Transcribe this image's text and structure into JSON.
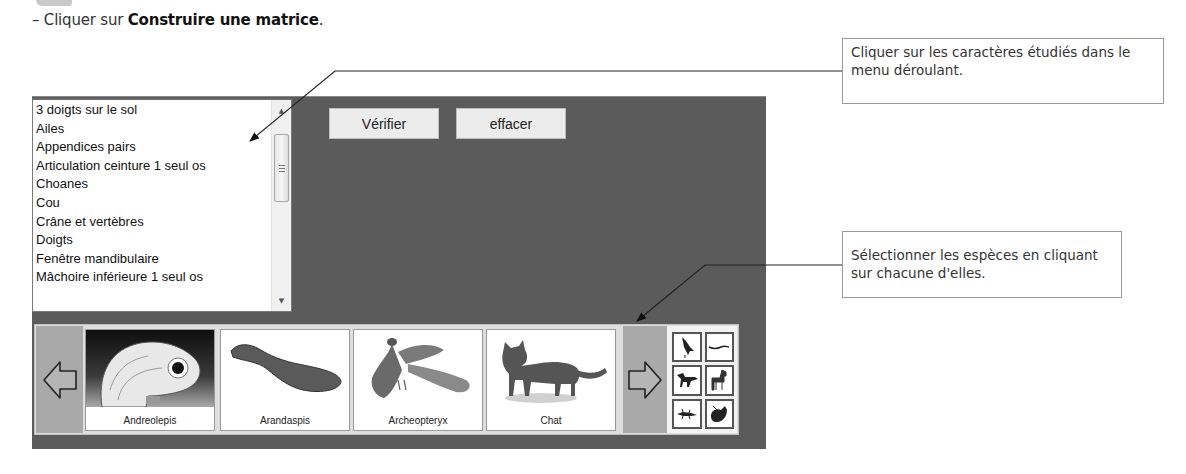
{
  "instruction": {
    "prefix": "– Cliquer sur ",
    "emphasis": "Construire une matrice",
    "suffix": "."
  },
  "characters_list": {
    "items": [
      "3 doigts sur le sol",
      "Ailes",
      "Appendices pairs",
      "Articulation ceinture 1 seul os",
      "Choanes",
      "Cou",
      "Crâne et vertèbres",
      "Doigts",
      "Fenêtre mandibulaire",
      "Mâchoire inférieure 1 seul os"
    ],
    "scroll_up_icon": "▲",
    "scroll_down_icon": "▼"
  },
  "toolbar": {
    "verify_label": "Vérifier",
    "clear_label": "effacer"
  },
  "species": {
    "cards": [
      {
        "name": "Andreolepis",
        "icon": "fish-head-icon"
      },
      {
        "name": "Arandaspis",
        "icon": "jawless-fish-icon"
      },
      {
        "name": "Archeopteryx",
        "icon": "bird-icon"
      },
      {
        "name": "Chat",
        "icon": "cat-icon"
      }
    ],
    "thumbnails": [
      {
        "icon": "bird-icon"
      },
      {
        "icon": "snake-icon"
      },
      {
        "icon": "dinosaur-icon"
      },
      {
        "icon": "horse-icon"
      },
      {
        "icon": "lizard-icon"
      },
      {
        "icon": "turtle-icon"
      }
    ]
  },
  "callouts": [
    {
      "text": "Cliquer sur les caractères étudiés dans le menu déroulant."
    },
    {
      "text": "Sélectionner les espèces en cliquant sur chacune d'elles."
    }
  ],
  "colors": {
    "panel_bg": "#5b5b5b",
    "button_bg": "#ececec",
    "nav_arrow_bg": "#a9a9a9",
    "callout_border": "#999999"
  }
}
